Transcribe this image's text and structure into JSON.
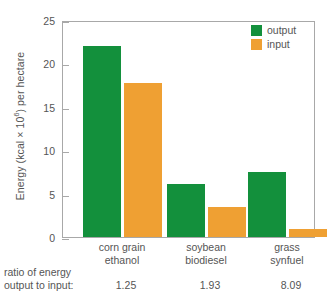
{
  "chart_data": {
    "type": "bar",
    "title": "",
    "xlabel": "",
    "ylabel": "Energy (kcal × 10⁶) per hectare",
    "ylabel_main": "Energy (kcal × 10",
    "ylabel_sup": "6",
    "ylabel_tail": ") per hectare",
    "ylim": [
      0,
      25
    ],
    "yticks": [
      0,
      5,
      10,
      15,
      20,
      25
    ],
    "ytick_labels": [
      "0",
      "5",
      "10",
      "15",
      "20",
      "25"
    ],
    "grid": false,
    "legend_position": "top-right",
    "categories": [
      "corn grain ethanol",
      "soybean biodiesel",
      "grass synfuel"
    ],
    "category_lines": [
      [
        "corn grain",
        "ethanol"
      ],
      [
        "soybean",
        "biodiesel"
      ],
      [
        "grass",
        "synfuel"
      ]
    ],
    "series": [
      {
        "name": "output",
        "color": "#13903c",
        "values": [
          22.0,
          6.1,
          7.5
        ]
      },
      {
        "name": "input",
        "color": "#efa033",
        "values": [
          17.8,
          3.5,
          0.9
        ]
      }
    ],
    "annotations": {
      "ratio_caption_line1": "ratio of energy",
      "ratio_caption_line2": "output to input:",
      "ratio_values": [
        "1.25",
        "1.93",
        "8.09"
      ]
    }
  },
  "legend": {
    "items": [
      {
        "label": "output",
        "color": "#13903c"
      },
      {
        "label": "input",
        "color": "#efa033"
      }
    ]
  },
  "colors": {
    "output": "#13903c",
    "input": "#efa033",
    "axis": "#a8a8a8",
    "text": "#555555",
    "background": "#ffffff"
  }
}
